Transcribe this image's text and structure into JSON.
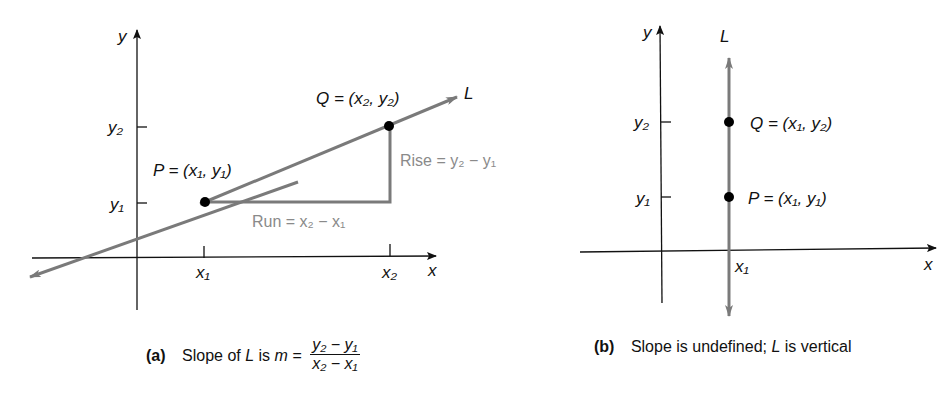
{
  "panel_a": {
    "tag": "(a)",
    "caption_text": "Slope of",
    "caption_L": "L",
    "caption_is": "is",
    "caption_m": "m =",
    "frac_num": "y₂ − y₁",
    "frac_den": "x₂ − x₁",
    "axis_x": "x",
    "axis_y": "y",
    "line_label": "L",
    "tick_x1": "x₁",
    "tick_x2": "x₂",
    "tick_y1": "y₁",
    "tick_y2": "y₂",
    "point_P": "P = (x₁, y₁)",
    "point_Q": "Q = (x₂, y₂)",
    "rise": "Rise = y₂ − y₁",
    "run": "Run = x₂ − x₁"
  },
  "panel_b": {
    "tag": "(b)",
    "caption": "Slope is undefined;",
    "caption_L": "L",
    "caption_end": "is vertical",
    "axis_x": "x",
    "axis_y": "y",
    "line_label": "L",
    "tick_x1": "x₁",
    "tick_y1": "y₁",
    "tick_y2": "y₂",
    "point_P": "P = (x₁, y₁)",
    "point_Q": "Q = (x₁, y₂)"
  },
  "colors": {
    "line": "#7a7a7a",
    "axis": "#111111",
    "point": "#000000",
    "annotation": "#8a8a8a"
  }
}
